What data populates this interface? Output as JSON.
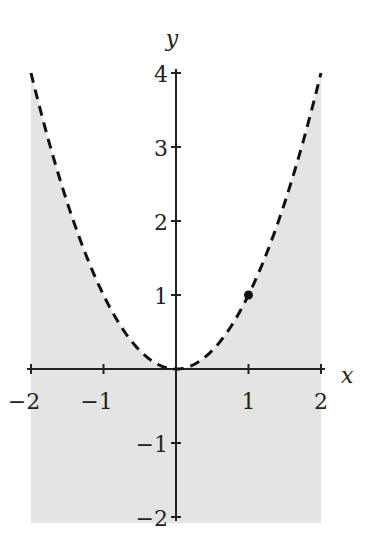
{
  "chart_data": {
    "type": "line",
    "title": "",
    "xlabel": "x",
    "ylabel": "y",
    "xlim": [
      -2,
      2
    ],
    "ylim": [
      -2,
      4
    ],
    "grid": false,
    "legend": null,
    "x_ticks": [
      -2,
      -1,
      1,
      2
    ],
    "x_tick_labels": [
      "−2",
      "−1",
      "1",
      "2"
    ],
    "y_ticks": [
      -2,
      -1,
      1,
      2,
      3,
      4
    ],
    "y_tick_labels": [
      "−2",
      "−1",
      "1",
      "2",
      "3",
      "4"
    ],
    "series": [
      {
        "name": "y = x^2 (boundary, dashed)",
        "style": "dashed",
        "color": "#111111",
        "function": "x^2",
        "x": [
          -2,
          -1.5,
          -1,
          -0.5,
          0,
          0.5,
          1,
          1.5,
          2
        ],
        "y": [
          4,
          2.25,
          1,
          0.25,
          0,
          0.25,
          1,
          2.25,
          4
        ]
      }
    ],
    "shaded_region": {
      "description": "y < x^2",
      "color": "#e4e4e4",
      "x_range": [
        -2,
        2
      ],
      "y_range": [
        -2,
        4
      ]
    },
    "points": [
      {
        "x": 1,
        "y": 1,
        "marker": "filled-circle",
        "color": "#111111"
      }
    ]
  },
  "colors": {
    "shade": "#e4e4e4",
    "curve": "#111111",
    "axis": "#222222",
    "background": "#ffffff"
  }
}
